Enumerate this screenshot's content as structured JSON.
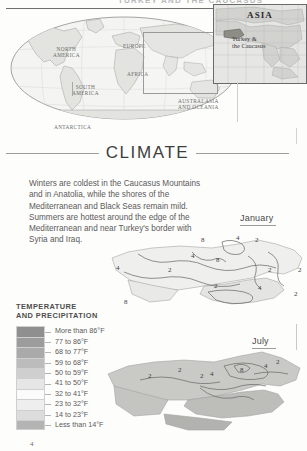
{
  "running_head": "TURKEY AND THE CAUCASUS",
  "locator": {
    "continents": [
      {
        "id": "north-america",
        "label": "NORTH\nAMERICA"
      },
      {
        "id": "europe",
        "label": "EUROPE"
      },
      {
        "id": "africa",
        "label": "AFRICA"
      },
      {
        "id": "south-america",
        "label": "SOUTH\nAMERICA"
      },
      {
        "id": "australasia",
        "label": "AUSTRALASIA\nAND OCEANIA"
      },
      {
        "id": "antarctica",
        "label": "ANTARCTICA"
      }
    ],
    "north_america": "NORTH AMERICA",
    "europe": "EUROPE",
    "africa": "AFRICA",
    "south_america": "SOUTH AMERICA",
    "australasia": "AUSTRALASIA AND OCEANIA",
    "antarctica": "ANTARCTICA"
  },
  "inset": {
    "title": "ASIA",
    "subtitle": "Turkey &\nthe Caucasus"
  },
  "section": {
    "heading": "CLIMATE",
    "body": "Winters are coldest in the Caucasus Mountains and in Anatolia, while the shores of the Mediterranean and Black Seas remain mild. Summers are hottest around the edge of the Mediterranean and near Turkey's border with Syria and Iraq."
  },
  "maps": [
    {
      "id": "january",
      "label": "January",
      "contour_labels": [
        "8",
        "4",
        "2",
        "4",
        "8",
        "2",
        "2",
        "4",
        "2",
        "2",
        "8",
        "4",
        "2"
      ]
    },
    {
      "id": "july",
      "label": "July",
      "contour_labels": [
        "2",
        "2",
        "2",
        "4",
        "8",
        "4",
        "2",
        "2"
      ]
    }
  ],
  "legend": {
    "title_line1": "TEMPERATURE",
    "title_line2": "AND PRECIPITATION",
    "entries": [
      {
        "label": "More than 86°F",
        "color": "#8f8f8f"
      },
      {
        "label": "77 to 86°F",
        "color": "#9c9c9c"
      },
      {
        "label": "68 to 77°F",
        "color": "#aaaaaa"
      },
      {
        "label": "59 to 68°F",
        "color": "#bcbcbc"
      },
      {
        "label": "50 to 59°F",
        "color": "#cfcfcf"
      },
      {
        "label": "41 to 50°F",
        "color": "#e6e6e6"
      },
      {
        "label": "32 to 41°F",
        "color": "#fbfbfb"
      },
      {
        "label": "23 to 32°F",
        "color": "#eeeeee"
      },
      {
        "label": "14 to 23°F",
        "color": "#dcdcdc"
      },
      {
        "label": "Less than 14°F",
        "color": "#b4b4b4"
      }
    ]
  },
  "page_number": "4"
}
